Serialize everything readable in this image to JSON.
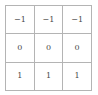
{
  "matrix": {
    "label": "3x3 matrix of values",
    "rows": [
      [
        "−1",
        "−1",
        "−1"
      ],
      [
        "0",
        "0",
        "0"
      ],
      [
        "1",
        "1",
        "1"
      ]
    ],
    "row_count": 3,
    "column_count": 3,
    "colors": {
      "background": "#ffffff",
      "outer_border": "#9a9a9a",
      "inner_border": "#b4b4b4",
      "text": "#4a4a4a"
    }
  }
}
